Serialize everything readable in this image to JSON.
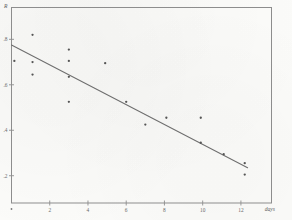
{
  "figure": {
    "kind": "scanned-scatter-plot-with-regression-line",
    "background": "#fbfbf9",
    "ink_color": "#5a5a5a"
  },
  "chart_data": {
    "type": "scatter",
    "title": "",
    "subtitle": "",
    "xlabel": "days",
    "ylabel": "R",
    "xlim": [
      0,
      13.6
    ],
    "ylim": [
      0.08,
      0.94
    ],
    "grid": false,
    "legend": null,
    "x_ticks": [
      2,
      4,
      6,
      8,
      10,
      12
    ],
    "x_tick_labels": [
      "2",
      "4",
      "6",
      "8",
      "10",
      "12"
    ],
    "y_ticks": [
      0.2,
      0.4,
      0.6,
      0.8
    ],
    "y_tick_labels": [
      ".2",
      ".4",
      ".6",
      ".8"
    ],
    "series": [
      {
        "name": "observations",
        "marker": "dot",
        "points": [
          {
            "x": 1.1,
            "y": 0.82
          },
          {
            "x": 1.1,
            "y": 0.7
          },
          {
            "x": 1.1,
            "y": 0.645
          },
          {
            "x": 0.15,
            "y": 0.705
          },
          {
            "x": 3.0,
            "y": 0.755
          },
          {
            "x": 3.0,
            "y": 0.705
          },
          {
            "x": 3.0,
            "y": 0.635
          },
          {
            "x": 3.0,
            "y": 0.525
          },
          {
            "x": 4.9,
            "y": 0.695
          },
          {
            "x": 6.0,
            "y": 0.525
          },
          {
            "x": 7.0,
            "y": 0.425
          },
          {
            "x": 8.1,
            "y": 0.455
          },
          {
            "x": 9.9,
            "y": 0.345
          },
          {
            "x": 9.9,
            "y": 0.455
          },
          {
            "x": 11.1,
            "y": 0.295
          },
          {
            "x": 12.2,
            "y": 0.255
          },
          {
            "x": 12.2,
            "y": 0.205
          }
        ]
      }
    ],
    "fit_line": {
      "name": "least-squares fit",
      "x_start": 0.0,
      "y_start": 0.775,
      "x_end": 12.35,
      "y_end": 0.235
    }
  },
  "axes": {
    "y_axis_label": "R",
    "x_axis_label": "days"
  }
}
